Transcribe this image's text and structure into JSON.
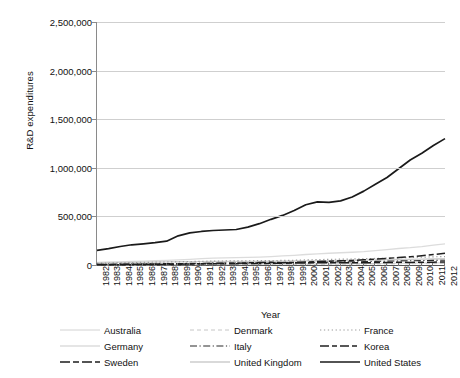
{
  "chart_data": {
    "type": "line",
    "title": "",
    "xlabel": "Year",
    "ylabel": "R&D expenditures",
    "grid": "horizontal",
    "legend_position": "bottom",
    "legend_columns": 3,
    "xlim": [
      1982,
      2012
    ],
    "ylim": [
      0,
      2500000
    ],
    "ytick_labels": [
      "2,500,000",
      "2,000,000",
      "1,500,000",
      "1,000,000",
      "500,000",
      "0"
    ],
    "ytick_values": [
      2500000,
      2000000,
      1500000,
      1000000,
      500000,
      0
    ],
    "categories": [
      "1982",
      "1983",
      "1984",
      "1985",
      "1986",
      "1987",
      "1988",
      "1989",
      "1990",
      "1991",
      "1992",
      "1993",
      "1994",
      "1995",
      "1996",
      "1997",
      "1998",
      "1999",
      "2000",
      "2001",
      "2002",
      "2003",
      "2004",
      "2005",
      "2006",
      "2007",
      "2008",
      "2009",
      "2010",
      "2011",
      "2012"
    ],
    "series": [
      {
        "name": "Australia",
        "style": "solid-faint",
        "values": [
          2500,
          2800,
          3100,
          3500,
          3900,
          4200,
          4500,
          4900,
          5300,
          5700,
          6100,
          6500,
          6900,
          7400,
          7900,
          8400,
          9000,
          9600,
          10300,
          11000,
          11800,
          12600,
          13500,
          14500,
          15600,
          16800,
          18100,
          19500,
          20800,
          22000,
          23000
        ]
      },
      {
        "name": "Denmark",
        "style": "dashed-faint",
        "values": [
          1100,
          1250,
          1400,
          1600,
          1800,
          2000,
          2250,
          2500,
          2800,
          3100,
          3400,
          3700,
          4000,
          4400,
          4800,
          5200,
          5700,
          6200,
          6800,
          7400,
          8000,
          8600,
          9200,
          9900,
          10700,
          11500,
          12400,
          13200,
          13900,
          14500,
          15000
        ]
      },
      {
        "name": "France",
        "style": "dotted",
        "values": [
          18000,
          20000,
          22500,
          25000,
          27000,
          29000,
          31000,
          33000,
          35500,
          38000,
          40000,
          41500,
          42500,
          43500,
          44500,
          45500,
          47000,
          49000,
          52000,
          55000,
          58000,
          60000,
          62000,
          64500,
          67500,
          70500,
          74500,
          77500,
          80500,
          84000,
          87000
        ]
      },
      {
        "name": "Germany",
        "style": "solid-verylight",
        "values": [
          28000,
          30000,
          33000,
          36000,
          40000,
          44000,
          48000,
          52000,
          58000,
          65000,
          70000,
          73000,
          75000,
          78000,
          82000,
          87000,
          93000,
          100000,
          108000,
          115000,
          121000,
          126000,
          131000,
          137000,
          147000,
          158000,
          170000,
          178000,
          190000,
          205000,
          218000
        ]
      },
      {
        "name": "Italy",
        "style": "dash-dot",
        "values": [
          7000,
          8000,
          9000,
          10000,
          11000,
          12500,
          14000,
          15500,
          17000,
          18500,
          19500,
          20000,
          20500,
          21000,
          22000,
          23000,
          24000,
          25500,
          27000,
          28500,
          30000,
          31500,
          33000,
          34500,
          37000,
          39500,
          42000,
          43500,
          45500,
          47500,
          49500
        ]
      },
      {
        "name": "Korea",
        "style": "dash-dash",
        "values": [
          1500,
          2000,
          2800,
          3600,
          4800,
          6000,
          7500,
          9000,
          11000,
          13000,
          15000,
          17000,
          19000,
          22000,
          25000,
          27500,
          24000,
          27000,
          31000,
          35000,
          39000,
          43000,
          47000,
          53000,
          60000,
          68000,
          77000,
          85000,
          96000,
          108000,
          120000
        ]
      },
      {
        "name": "Sweden",
        "style": "dash-long",
        "values": [
          5000,
          5500,
          6500,
          7500,
          8200,
          9000,
          9800,
          10500,
          11500,
          12500,
          13000,
          13500,
          14000,
          15000,
          16000,
          17000,
          18500,
          20000,
          21500,
          23000,
          23500,
          23000,
          22500,
          23000,
          24500,
          26000,
          27500,
          27000,
          28000,
          29500,
          30500
        ]
      },
      {
        "name": "United Kingdom",
        "style": "solid-light",
        "values": [
          24000,
          25500,
          27000,
          28500,
          29500,
          31000,
          32500,
          33500,
          34500,
          35000,
          35500,
          36000,
          36500,
          37000,
          37500,
          38000,
          39000,
          40500,
          42000,
          43500,
          45000,
          46500,
          48000,
          50000,
          52000,
          55000,
          57000,
          58000,
          60000,
          62500,
          65000
        ]
      },
      {
        "name": "United States",
        "style": "solid-thick",
        "values": [
          150000,
          168000,
          190000,
          208000,
          218000,
          230000,
          245000,
          300000,
          330000,
          345000,
          355000,
          360000,
          365000,
          390000,
          425000,
          470000,
          510000,
          560000,
          620000,
          650000,
          645000,
          660000,
          700000,
          760000,
          830000,
          900000,
          990000,
          1080000,
          1150000,
          1230000,
          1300000
        ]
      }
    ]
  },
  "legend": {
    "entries": [
      {
        "label": "Australia",
        "key": "solid-faint"
      },
      {
        "label": "Denmark",
        "key": "dashed-faint"
      },
      {
        "label": "France",
        "key": "dotted"
      },
      {
        "label": "Germany",
        "key": "solid-verylight"
      },
      {
        "label": "Italy",
        "key": "dash-dot"
      },
      {
        "label": "Korea",
        "key": "dash-dash"
      },
      {
        "label": "Sweden",
        "key": "dash-long"
      },
      {
        "label": "United Kingdom",
        "key": "solid-light"
      },
      {
        "label": "United States",
        "key": "solid-thick"
      }
    ]
  },
  "colors": {
    "background": "#ffffff",
    "grid": "#cfcfcf",
    "axis": "#555555",
    "text": "#111111",
    "series_dark": "#1a1a1a",
    "series_mid": "#8c8c8c",
    "series_light": "#c8c8c8"
  }
}
